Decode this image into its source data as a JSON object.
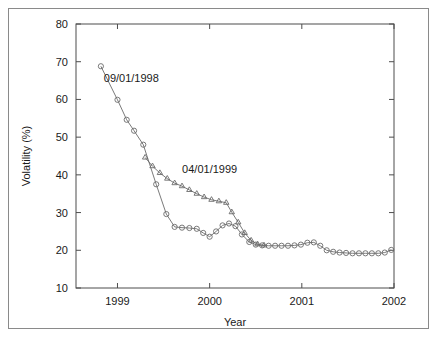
{
  "chart_data": {
    "type": "line",
    "title": "",
    "xlabel": "Year",
    "ylabel": "Volatility (%)",
    "xlim": [
      1998.55,
      2002.0
    ],
    "ylim": [
      10,
      80
    ],
    "xticks": [
      1999,
      2000,
      2001,
      2002
    ],
    "xticklabels": [
      "1999",
      "2000",
      "2001",
      "2002"
    ],
    "yticks": [
      10,
      20,
      30,
      40,
      50,
      60,
      70,
      80
    ],
    "yticklabels": [
      "10",
      "20",
      "30",
      "40",
      "50",
      "60",
      "70",
      "80"
    ],
    "grid": false,
    "legend_position": "inline-annotations",
    "annotations": [
      {
        "text": "09/01/1998",
        "x": 1999.15,
        "y": 64.5
      },
      {
        "text": "04/01/1999",
        "x": 2000.0,
        "y": 40.5
      }
    ],
    "series": [
      {
        "name": "09/01/1998",
        "marker": "circle",
        "color": "#6b6b6b",
        "points": [
          {
            "x": 1998.82,
            "y": 68.8
          },
          {
            "x": 1999.0,
            "y": 59.9
          },
          {
            "x": 1999.1,
            "y": 54.6
          },
          {
            "x": 1999.18,
            "y": 51.7
          },
          {
            "x": 1999.28,
            "y": 48.0
          },
          {
            "x": 1999.42,
            "y": 37.5
          },
          {
            "x": 1999.53,
            "y": 29.6
          },
          {
            "x": 1999.62,
            "y": 26.2
          },
          {
            "x": 1999.7,
            "y": 26.0
          },
          {
            "x": 1999.78,
            "y": 25.9
          },
          {
            "x": 1999.86,
            "y": 25.7
          },
          {
            "x": 1999.93,
            "y": 24.6
          },
          {
            "x": 2000.0,
            "y": 23.6
          },
          {
            "x": 2000.07,
            "y": 25.0
          },
          {
            "x": 2000.14,
            "y": 26.6
          },
          {
            "x": 2000.21,
            "y": 27.1
          },
          {
            "x": 2000.28,
            "y": 26.4
          },
          {
            "x": 2000.35,
            "y": 24.2
          },
          {
            "x": 2000.43,
            "y": 22.2
          },
          {
            "x": 2000.5,
            "y": 21.5
          },
          {
            "x": 2000.57,
            "y": 21.3
          },
          {
            "x": 2000.64,
            "y": 21.2
          },
          {
            "x": 2000.71,
            "y": 21.2
          },
          {
            "x": 2000.78,
            "y": 21.2
          },
          {
            "x": 2000.85,
            "y": 21.2
          },
          {
            "x": 2000.92,
            "y": 21.3
          },
          {
            "x": 2000.99,
            "y": 21.5
          },
          {
            "x": 2001.06,
            "y": 22.0
          },
          {
            "x": 2001.13,
            "y": 22.1
          },
          {
            "x": 2001.2,
            "y": 21.2
          },
          {
            "x": 2001.27,
            "y": 20.0
          },
          {
            "x": 2001.34,
            "y": 19.6
          },
          {
            "x": 2001.41,
            "y": 19.4
          },
          {
            "x": 2001.48,
            "y": 19.3
          },
          {
            "x": 2001.55,
            "y": 19.2
          },
          {
            "x": 2001.62,
            "y": 19.2
          },
          {
            "x": 2001.69,
            "y": 19.2
          },
          {
            "x": 2001.76,
            "y": 19.2
          },
          {
            "x": 2001.83,
            "y": 19.2
          },
          {
            "x": 2001.9,
            "y": 19.4
          },
          {
            "x": 2001.97,
            "y": 20.1
          }
        ]
      },
      {
        "name": "04/01/1999",
        "marker": "triangle",
        "color": "#6b6b6b",
        "points": [
          {
            "x": 1999.3,
            "y": 44.6
          },
          {
            "x": 1999.38,
            "y": 42.3
          },
          {
            "x": 1999.46,
            "y": 40.5
          },
          {
            "x": 1999.54,
            "y": 39.0
          },
          {
            "x": 1999.62,
            "y": 37.8
          },
          {
            "x": 1999.7,
            "y": 37.0
          },
          {
            "x": 1999.78,
            "y": 36.0
          },
          {
            "x": 1999.86,
            "y": 35.0
          },
          {
            "x": 1999.94,
            "y": 34.1
          },
          {
            "x": 2000.02,
            "y": 33.4
          },
          {
            "x": 2000.1,
            "y": 33.0
          },
          {
            "x": 2000.18,
            "y": 32.6
          },
          {
            "x": 2000.24,
            "y": 30.1
          },
          {
            "x": 2000.31,
            "y": 27.4
          },
          {
            "x": 2000.38,
            "y": 24.6
          },
          {
            "x": 2000.45,
            "y": 22.6
          },
          {
            "x": 2000.52,
            "y": 21.6
          },
          {
            "x": 2000.59,
            "y": 21.3
          }
        ]
      }
    ]
  }
}
